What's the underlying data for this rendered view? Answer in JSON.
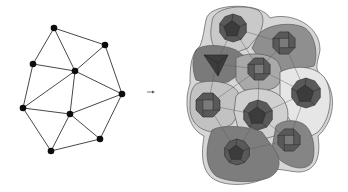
{
  "diagram": {
    "left_graph": {
      "nodes": [
        {
          "id": "n1",
          "x": 54,
          "y": 28
        },
        {
          "id": "n2",
          "x": 105,
          "y": 45
        },
        {
          "id": "n3",
          "x": 33,
          "y": 64
        },
        {
          "id": "n4",
          "x": 75,
          "y": 71
        },
        {
          "id": "n5",
          "x": 122,
          "y": 94
        },
        {
          "id": "n6",
          "x": 23,
          "y": 108
        },
        {
          "id": "n7",
          "x": 70,
          "y": 114
        },
        {
          "id": "n8",
          "x": 100,
          "y": 139
        },
        {
          "id": "n9",
          "x": 51,
          "y": 151
        }
      ],
      "edges": [
        [
          "n1",
          "n2"
        ],
        [
          "n1",
          "n3"
        ],
        [
          "n1",
          "n4"
        ],
        [
          "n2",
          "n4"
        ],
        [
          "n2",
          "n5"
        ],
        [
          "n3",
          "n4"
        ],
        [
          "n3",
          "n6"
        ],
        [
          "n4",
          "n6"
        ],
        [
          "n4",
          "n5"
        ],
        [
          "n4",
          "n7"
        ],
        [
          "n6",
          "n7"
        ],
        [
          "n7",
          "n5"
        ],
        [
          "n6",
          "n9"
        ],
        [
          "n7",
          "n9"
        ],
        [
          "n7",
          "n8"
        ],
        [
          "n5",
          "n8"
        ],
        [
          "n9",
          "n8"
        ]
      ],
      "colors": {
        "edge": "#333333",
        "node": "#111111"
      }
    },
    "arrow": {
      "symbol": "→",
      "x1": 147,
      "y1": 92,
      "x2": 155,
      "y2": 92,
      "color": "#555555"
    },
    "right_complex": {
      "cells": [
        {
          "id": "c1",
          "shade": "#c9c9c9",
          "poly_type": "pentagon",
          "cx": 233,
          "cy": 28,
          "r": 14
        },
        {
          "id": "c2",
          "shade": "#8f8f8f",
          "poly_type": "cube",
          "cx": 284,
          "cy": 43,
          "r": 12
        },
        {
          "id": "c3",
          "shade": "#7a7a7a",
          "poly_type": "tetrahedron",
          "cx": 216,
          "cy": 64,
          "r": 13
        },
        {
          "id": "c4",
          "shade": "#a9a9a9",
          "poly_type": "cube",
          "cx": 259,
          "cy": 69,
          "r": 12
        },
        {
          "id": "c5",
          "shade": "#e6e6e6",
          "poly_type": "pentagon",
          "cx": 306,
          "cy": 93,
          "r": 15
        },
        {
          "id": "c6",
          "shade": "#c2c2c2",
          "poly_type": "cube",
          "cx": 208,
          "cy": 105,
          "r": 13
        },
        {
          "id": "c7",
          "shade": "#d0d0d0",
          "poly_type": "pentagon",
          "cx": 258,
          "cy": 115,
          "r": 15
        },
        {
          "id": "c8",
          "shade": "#858585",
          "poly_type": "cube",
          "cx": 289,
          "cy": 140,
          "r": 12
        },
        {
          "id": "c9",
          "shade": "#7d7d7d",
          "poly_type": "pentagon",
          "cx": 237,
          "cy": 152,
          "r": 13
        }
      ],
      "colors": {
        "outline": "#5a5a5a",
        "polyhedron_dark": "#3c3c3c",
        "polyhedron_mid": "#595959",
        "polyhedron_light": "#7a7a7a"
      }
    }
  }
}
